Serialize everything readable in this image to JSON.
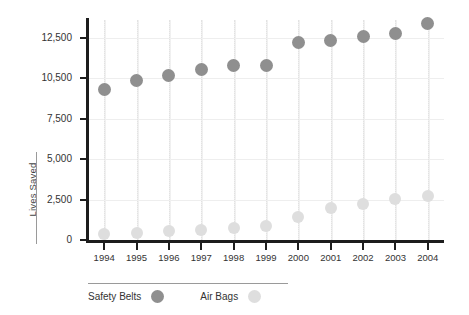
{
  "chart_data": {
    "type": "scatter",
    "title": "",
    "subtitle": "",
    "xlabel": "",
    "ylabel": "Lives Saved",
    "grid": true,
    "legend_position": "bottom-left",
    "categories": [
      "1994",
      "1995",
      "1996",
      "1997",
      "1998",
      "1999",
      "2000",
      "2001",
      "2002",
      "2003",
      "2004"
    ],
    "y_ticks": [
      "0",
      "2,500",
      "5,000",
      "7,500",
      "10,500",
      "12,500"
    ],
    "y_tick_values": [
      0,
      2500,
      5000,
      7500,
      10500,
      12500
    ],
    "ylim": [
      0,
      13500
    ],
    "series": [
      {
        "name": "Safety Belts",
        "color": "#8f8f8f",
        "values": [
          9700,
          10350,
          10650,
          10950,
          11150,
          11150,
          12300,
          12400,
          12550,
          12700,
          13200
        ]
      },
      {
        "name": "Air Bags",
        "color": "#dedede",
        "values": [
          400,
          450,
          550,
          600,
          750,
          850,
          1450,
          2000,
          2250,
          2550,
          2750
        ]
      }
    ],
    "colors": {
      "axis": "#1d1d1d",
      "grid": "#eeeeee",
      "text": "#333333",
      "background": "#ffffff"
    }
  },
  "legend": {
    "items": [
      {
        "label": "Safety Belts",
        "color": "#8f8f8f"
      },
      {
        "label": "Air Bags",
        "color": "#dedede"
      }
    ]
  }
}
